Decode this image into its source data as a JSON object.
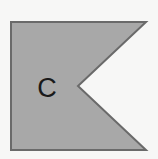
{
  "image": {
    "title": "Guidon flag with letter C",
    "width": 158,
    "height": 159,
    "background_color": "#f7f7f6"
  },
  "flag": {
    "name": "guidon",
    "shape": "swallow-tailed pennant",
    "fill_color": "#a8a8a8",
    "border_color": "#6a6a6a",
    "border_width": 2,
    "points": "11,22 146,22 78,86 146,150 11,150",
    "vertices": [
      {
        "label": "top-left-hoist",
        "x": 11,
        "y": 22
      },
      {
        "label": "top-right-fly-tip",
        "x": 146,
        "y": 22
      },
      {
        "label": "notch-apex",
        "x": 78,
        "y": 86
      },
      {
        "label": "bottom-right-fly-tip",
        "x": 146,
        "y": 150
      },
      {
        "label": "bottom-left-hoist",
        "x": 11,
        "y": 150
      }
    ]
  },
  "letter": {
    "text": "C",
    "color": "#1a1a1a",
    "x": 47,
    "y": 97,
    "font_size": 27
  }
}
